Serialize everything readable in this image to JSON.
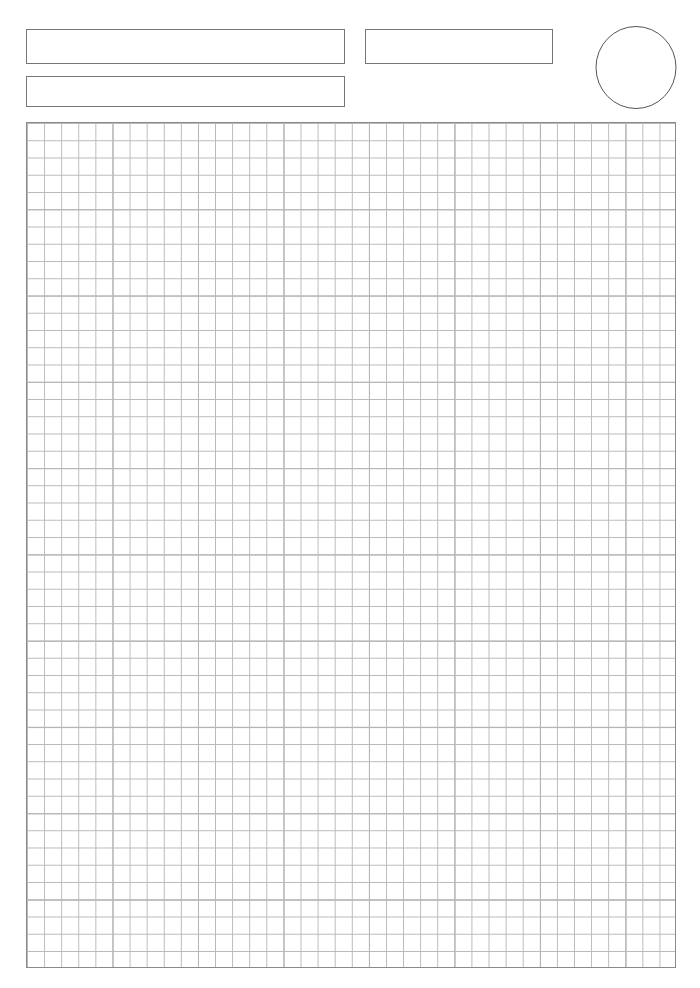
{
  "document": {
    "kind": "blank-worksheet-form",
    "page_width": 700,
    "page_height": 988,
    "background_color": "#ffffff",
    "ink_color": "#767676"
  },
  "header": {
    "title_field": {
      "label": "title-field",
      "value": "",
      "placeholder": ""
    },
    "subtitle_field": {
      "label": "subtitle-field",
      "value": "",
      "placeholder": ""
    },
    "meta_field": {
      "label": "meta-field",
      "value": "",
      "placeholder": ""
    },
    "stamp": {
      "shape": "ellipse",
      "label": "",
      "stroke_color": "#555555"
    }
  },
  "grid": {
    "label": "graph-paper-area",
    "columns": 38,
    "rows": 49,
    "cell_size_px": 17,
    "minor_line_color": "#b9b9b9",
    "major_line_color": "#a2a2a2",
    "border_color": "#8a8a8a",
    "major_every": 5,
    "content": ""
  }
}
